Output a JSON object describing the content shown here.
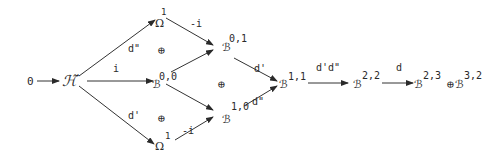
{
  "diagram": {
    "type": "commutative-diagram",
    "colors": {
      "ink": "#2a2a2a",
      "background": "#ffffff"
    },
    "nodes": {
      "zero": {
        "label": "0"
      },
      "H": {
        "label": "ℋ̃"
      },
      "omega_top": {
        "label": "Ω",
        "sup": "1"
      },
      "B00": {
        "label": "ℬ",
        "sup": "0,0"
      },
      "omega_bot": {
        "label": "Ω",
        "sup": "1"
      },
      "B01": {
        "label": "ℬ",
        "sup": "0,1"
      },
      "B10": {
        "label": "ℬ",
        "sup": "1,0"
      },
      "B11": {
        "label": "ℬ",
        "sup": "1,1"
      },
      "B22": {
        "label": "ℬ",
        "sup": "2,2"
      },
      "B23": {
        "label": "ℬ",
        "sup": "2,3"
      },
      "oplus_final": {
        "label": "⊕"
      },
      "B32": {
        "label": "ℬ",
        "sup": "3,2"
      }
    },
    "direct_sums": {
      "left_top": "⊕",
      "left_bottom": "⊕",
      "middle": "⊕"
    },
    "arrow_labels": {
      "H_to_omega_top": "d\"",
      "H_to_B00": "i",
      "H_to_omega_bot": "d'",
      "omega_top_to_B01": "-i",
      "omega_bot_to_B10": "-i",
      "B01_to_B11": "d'",
      "B10_to_B11": "d\"",
      "B11_to_B22": "d'd\"",
      "B22_to_B23": "d"
    }
  }
}
